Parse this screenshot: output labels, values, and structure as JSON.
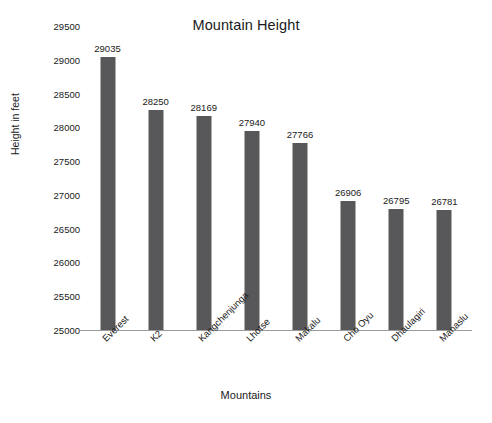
{
  "chart_data": {
    "type": "bar",
    "title": "Mountain Height",
    "xlabel": "Mountains",
    "ylabel": "Height in feet",
    "categories": [
      "Everest",
      "K2",
      "Kangchenjunga",
      "Lhotse",
      "Makalu",
      "Cho Oyu",
      "Dhaulagiri",
      "Manaslu"
    ],
    "values": [
      29035,
      28250,
      28169,
      27940,
      27766,
      26906,
      26795,
      26781
    ],
    "value_labels": [
      "29035",
      "28250",
      "28169",
      "27940",
      "27766",
      "26906",
      "26795",
      "26781"
    ],
    "ylim": [
      25000,
      29500
    ],
    "ytick_values": [
      25000,
      25500,
      26000,
      26500,
      27000,
      27500,
      28000,
      28500,
      29000,
      29500
    ],
    "ytick_labels": [
      "25000",
      "25500",
      "26000",
      "26500",
      "27000",
      "27500",
      "28000",
      "28500",
      "29000",
      "29500"
    ],
    "grid": false,
    "legend": false,
    "bar_color": "#58585A",
    "text_color": "#1A1A1A",
    "axis_color": "#9A9A9A",
    "background": "#FFFFFF",
    "xtick_rotation": 45
  }
}
